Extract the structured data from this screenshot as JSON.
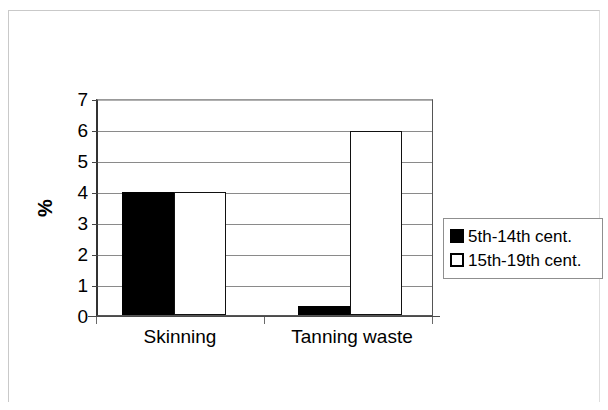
{
  "chart_data": {
    "type": "bar",
    "title": "",
    "subtitle": "",
    "xlabel": "",
    "ylabel": "%",
    "ylim": [
      0,
      7
    ],
    "ytick_values": [
      0,
      1,
      2,
      3,
      4,
      5,
      6,
      7
    ],
    "ytick_labels": [
      "0",
      "1",
      "2",
      "3",
      "4",
      "5",
      "6",
      "7"
    ],
    "grid": true,
    "grid_axis": "y",
    "legend_position": "right",
    "categories": [
      "Skinning",
      "Tanning waste"
    ],
    "series": [
      {
        "name": "5th-14th cent.",
        "color": "#000000",
        "fill": "solid-black",
        "values": [
          4,
          0.3
        ]
      },
      {
        "name": "15th-19th cent.",
        "color": "#ffffff",
        "fill": "white-with-black-outline",
        "values": [
          4,
          6
        ]
      }
    ]
  },
  "legend": {
    "entries": [
      {
        "label": "5th-14th cent.",
        "swatch": "filled-black-square"
      },
      {
        "label": "15th-19th cent.",
        "swatch": "empty-white-square"
      }
    ]
  },
  "axes": {
    "y_title": "%",
    "y_ticks": [
      "7",
      "6",
      "5",
      "4",
      "3",
      "2",
      "1",
      "0"
    ],
    "x_categories": [
      "Skinning",
      "Tanning waste"
    ]
  },
  "colors": {
    "series_dark": "#000000",
    "series_light": "#ffffff",
    "gridline": "#8a8a8a",
    "axis": "#333333",
    "page_frame": "#c9c9c9",
    "background": "#ffffff"
  }
}
